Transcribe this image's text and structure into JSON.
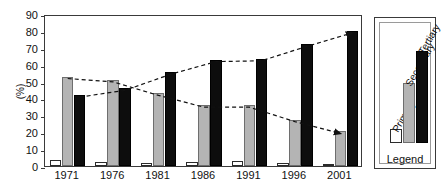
{
  "chart_data": {
    "type": "bar",
    "title": "",
    "subtitle": "",
    "xlabel": "",
    "ylabel": "(%)",
    "ylim": [
      0,
      90
    ],
    "ytick_step": 10,
    "yticks": [
      "90",
      "80",
      "70",
      "60",
      "50",
      "40",
      "30",
      "20",
      "10",
      "0"
    ],
    "grid": false,
    "legend_position": "right-outside",
    "legend_title": "Legend",
    "categories": [
      "1971",
      "1976",
      "1981",
      "1986",
      "1991",
      "1996",
      "2001"
    ],
    "series": [
      {
        "name": "Primary",
        "color": "#ffffff",
        "values": [
          3.5,
          2.5,
          1.5,
          2.5,
          3.0,
          2.0,
          1.0
        ]
      },
      {
        "name": "Secondary",
        "color": "#b4b4b4",
        "values": [
          53.0,
          51.0,
          43.0,
          36.0,
          36.0,
          27.5,
          20.5
        ]
      },
      {
        "name": "Tertiary",
        "color": "#0d0d0d",
        "values": [
          42.0,
          46.0,
          55.5,
          63.0,
          63.5,
          72.0,
          80.0
        ]
      }
    ],
    "annotations": [
      {
        "name": "secondary-trend-arrow",
        "series": "Secondary",
        "style": "dashed-line-with-arrowhead",
        "direction": "decreasing",
        "from": {
          "x": "1971",
          "y": 53.0
        },
        "to": {
          "x": "2001",
          "y": 20.5
        }
      },
      {
        "name": "tertiary-trend-arrow",
        "series": "Tertiary",
        "style": "dashed-line-with-arrowhead",
        "direction": "increasing",
        "from": {
          "x": "1971",
          "y": 42.0
        },
        "to": {
          "x": "2001",
          "y": 80.0
        }
      }
    ]
  },
  "axis": {
    "y_label": "(%)",
    "y_ticks": [
      "90",
      "80",
      "70",
      "60",
      "50",
      "40",
      "30",
      "20",
      "10",
      "0"
    ],
    "x_ticks": [
      "1971",
      "1976",
      "1981",
      "1986",
      "1991",
      "1996",
      "2001"
    ]
  },
  "legend": {
    "caption": "Legend",
    "entries": [
      {
        "label": "Primary",
        "swatch": "white-outlined"
      },
      {
        "label": "Secondary",
        "swatch": "gray-filled"
      },
      {
        "label": "Tertiary",
        "swatch": "black-filled"
      }
    ]
  },
  "colors": {
    "primary": "#ffffff",
    "secondary": "#b4b4b4",
    "tertiary": "#0d0d0d",
    "axis": "#3a3a3a",
    "background": "#ffffff"
  }
}
